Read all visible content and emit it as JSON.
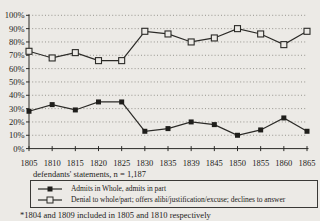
{
  "chart_data": {
    "type": "line",
    "x_tick_labels": [
      "1805",
      "1810",
      "1815",
      "1820",
      "1825",
      "1830",
      "1835",
      "1839",
      "1845",
      "1850",
      "1855",
      "1860",
      "1865"
    ],
    "y_ticks": [
      "0%",
      "10%",
      "20%",
      "30%",
      "40%",
      "50%",
      "60%",
      "70%",
      "80%",
      "90%",
      "100%"
    ],
    "ylim": [
      0,
      100
    ],
    "grid": "horizontal-dotted",
    "legend_position": "bottom",
    "series": [
      {
        "name": "Admits in Whole, admits in part",
        "marker": "filled-square",
        "values": [
          28,
          33,
          29,
          35,
          35,
          13,
          15,
          20,
          18,
          10,
          14,
          23,
          13
        ]
      },
      {
        "name": "Denial to whole/part; offers alibi/justification/excuse; declines to answer",
        "marker": "open-square",
        "values": [
          73,
          68,
          72,
          66,
          66,
          88,
          86,
          80,
          83,
          90,
          86,
          78,
          88
        ]
      }
    ],
    "xlabel": "defendants' statements, n = 1,187",
    "footnote": "*1804 and 1809 included in 1805 and 1810 respectively"
  },
  "colors": {
    "background": "#ECEAE6",
    "line": "#2B2A27",
    "grid": "#8D8B85",
    "text": "#1D1C1A"
  }
}
